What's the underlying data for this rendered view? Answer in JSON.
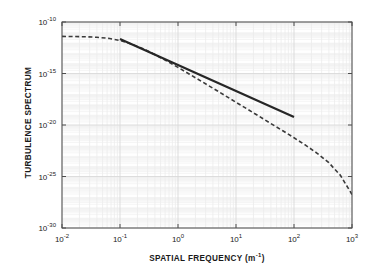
{
  "figure": {
    "background": "#ffffff",
    "frame_color": "#4d4d4d",
    "grid_color": "#d9d9d9",
    "minor_grid_color": "#ececec"
  },
  "axes": {
    "x": {
      "label": "SPATIAL FREQUENCY (m",
      "label_sup": "-1",
      "label_tail": ")",
      "scale": "log",
      "min": 0.01,
      "max": 1000,
      "ticks": [
        {
          "value": 0.01,
          "mantissa": "10",
          "exponent": "-2"
        },
        {
          "value": 0.1,
          "mantissa": "10",
          "exponent": "-1"
        },
        {
          "value": 1,
          "mantissa": "10",
          "exponent": "0"
        },
        {
          "value": 10,
          "mantissa": "10",
          "exponent": "1"
        },
        {
          "value": 100,
          "mantissa": "10",
          "exponent": "2"
        },
        {
          "value": 1000,
          "mantissa": "10",
          "exponent": "3"
        }
      ]
    },
    "y": {
      "label": "TURBULENCE SPECTRUM",
      "scale": "log",
      "min": 1e-30,
      "max": 1e-10,
      "ticks": [
        {
          "value": 1e-10,
          "mantissa": "10",
          "exponent": "-10"
        },
        {
          "value": 1e-15,
          "mantissa": "10",
          "exponent": "-15"
        },
        {
          "value": 1e-20,
          "mantissa": "10",
          "exponent": "-20"
        },
        {
          "value": 1e-25,
          "mantissa": "10",
          "exponent": "-25"
        },
        {
          "value": 1e-30,
          "mantissa": "10",
          "exponent": "-30"
        }
      ]
    }
  },
  "chart_data": {
    "type": "line",
    "title": "",
    "xlabel": "SPATIAL FREQUENCY (m^-1)",
    "ylabel": "TURBULENCE SPECTRUM",
    "xscale": "log",
    "yscale": "log",
    "xlim": [
      0.01,
      1000
    ],
    "ylim": [
      1e-30,
      1e-10
    ],
    "grid": true,
    "legend": "none",
    "series": [
      {
        "name": "von Karman spectrum",
        "style": "dashed",
        "color": "#3a3a3a",
        "linewidth": 1.6,
        "x": [
          0.01,
          0.0158,
          0.0251,
          0.0398,
          0.0631,
          0.1,
          0.158,
          0.251,
          0.398,
          0.631,
          1.0,
          1.58,
          2.51,
          3.98,
          6.31,
          10.0,
          15.8,
          25.1,
          39.8,
          63.1,
          100.0,
          158.0,
          251.0,
          398.0,
          631.0,
          1000.0
        ],
        "y": [
          4e-12,
          3.9e-12,
          3.7e-12,
          3.3e-12,
          2.6e-12,
          1.6e-12,
          7.3e-13,
          2.5e-13,
          7e-14,
          1.7e-14,
          3.9e-15,
          8.5e-16,
          1.8e-16,
          3.8e-17,
          7.9e-18,
          1.6e-18,
          3.4e-19,
          7e-20,
          1.4e-20,
          2.9e-21,
          5.8e-22,
          1.1e-22,
          1.8e-23,
          2.2e-24,
          1.3e-25,
          1.8e-27
        ]
      },
      {
        "name": "Kolmogorov -11/3 power law",
        "style": "solid",
        "color": "#262626",
        "linewidth": 2.2,
        "slope_exponent": -3.667,
        "x": [
          0.1,
          0.316,
          1.0,
          3.16,
          10.0,
          31.6,
          100.0
        ],
        "y": [
          2.2e-12,
          1.2e-13,
          6.6e-15,
          3.6e-16,
          2e-17,
          1.1e-18,
          6e-20
        ]
      }
    ]
  }
}
